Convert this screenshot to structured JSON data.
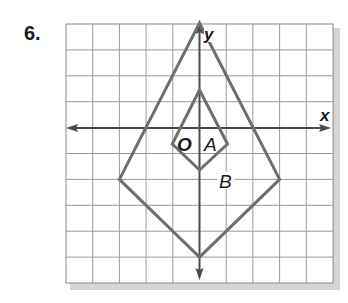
{
  "problem": {
    "number": "6."
  },
  "graph": {
    "grid": {
      "columns": 10,
      "rows": 10,
      "x_range": [
        -5,
        5
      ],
      "y_range": [
        -6,
        4
      ]
    },
    "axes": {
      "x_label": "x",
      "y_label": "y",
      "origin_label": "O"
    },
    "figures": [
      {
        "label": "A",
        "vertices": [
          [
            0,
            1.5
          ],
          [
            1,
            -0.6
          ],
          [
            0,
            -1.6
          ],
          [
            -1,
            -0.6
          ]
        ]
      },
      {
        "label": "B",
        "vertices": [
          [
            0,
            4
          ],
          [
            3,
            -2
          ],
          [
            0,
            -5
          ],
          [
            -3,
            -2
          ]
        ]
      }
    ]
  },
  "colors": {
    "grid": "#9a9a9a",
    "axis": "#4a4a4a",
    "figure": "#6e6e6e",
    "shadow": "#c8c8c8"
  }
}
